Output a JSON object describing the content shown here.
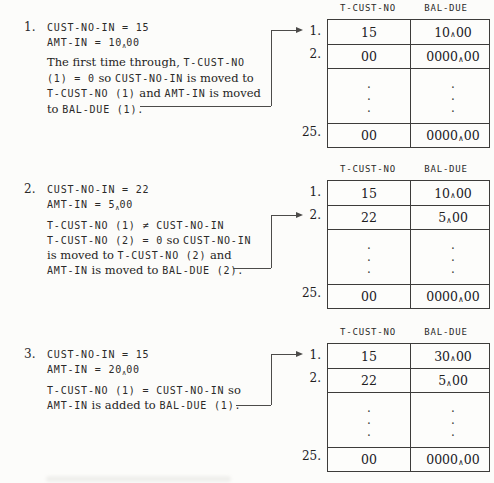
{
  "glyphs": {
    "dot": ".",
    "caret": "∧"
  },
  "sections": [
    {
      "number": "1.",
      "code": [
        [
          {
            "k": "c",
            "t": "CUST-NO-IN = 15"
          }
        ],
        [
          {
            "k": "c",
            "t": "AMT-IN = 10"
          },
          {
            "k": "x",
            "t": "∧"
          },
          {
            "k": "c",
            "t": "00"
          }
        ]
      ],
      "para": [
        [
          {
            "k": "p",
            "t": "The first time through, "
          },
          {
            "k": "c",
            "t": "T-CUST-NO"
          }
        ],
        [
          {
            "k": "c",
            "t": "(1) = 0"
          },
          {
            "k": "p",
            "t": " so "
          },
          {
            "k": "c",
            "t": "CUST-NO-IN"
          },
          {
            "k": "p",
            "t": " is moved to"
          }
        ],
        [
          {
            "k": "c",
            "t": "T-CUST-NO (1)"
          },
          {
            "k": "p",
            "t": " and "
          },
          {
            "k": "c",
            "t": "AMT-IN"
          },
          {
            "k": "p",
            "t": " is moved"
          }
        ],
        [
          {
            "k": "p",
            "t": "to "
          },
          {
            "k": "c",
            "t": "BAL-DUE (1)."
          }
        ]
      ]
    },
    {
      "number": "2.",
      "code": [
        [
          {
            "k": "c",
            "t": "CUST-NO-IN = 22"
          }
        ],
        [
          {
            "k": "c",
            "t": "AMT-IN = 5"
          },
          {
            "k": "x",
            "t": "∧"
          },
          {
            "k": "c",
            "t": "00"
          }
        ]
      ],
      "para": [
        [
          {
            "k": "c",
            "t": "T-CUST-NO (1) ≠ CUST-NO-IN"
          }
        ],
        [
          {
            "k": "c",
            "t": "T-CUST-NO (2) = 0"
          },
          {
            "k": "p",
            "t": " so "
          },
          {
            "k": "c",
            "t": "CUST-NO-IN"
          }
        ],
        [
          {
            "k": "p",
            "t": "is moved to "
          },
          {
            "k": "c",
            "t": "T-CUST-NO (2)"
          },
          {
            "k": "p",
            "t": " and"
          }
        ],
        [
          {
            "k": "c",
            "t": "AMT-IN"
          },
          {
            "k": "p",
            "t": " is moved to "
          },
          {
            "k": "c",
            "t": "BAL-DUE (2)."
          }
        ]
      ]
    },
    {
      "number": "3.",
      "code": [
        [
          {
            "k": "c",
            "t": "CUST-NO-IN = 15"
          }
        ],
        [
          {
            "k": "c",
            "t": "AMT-IN = 20"
          },
          {
            "k": "x",
            "t": "∧"
          },
          {
            "k": "c",
            "t": "00"
          }
        ]
      ],
      "para": [
        [
          {
            "k": "c",
            "t": "T-CUST-NO (1) = CUST-NO-IN"
          },
          {
            "k": "p",
            "t": " so"
          }
        ],
        [
          {
            "k": "c",
            "t": "AMT-IN"
          },
          {
            "k": "p",
            "t": " is added to "
          },
          {
            "k": "c",
            "t": "BAL-DUE (1)."
          }
        ]
      ]
    }
  ],
  "tables": [
    {
      "headers": [
        "T-CUST-NO",
        "BAL-DUE"
      ],
      "arrow_points_to": "1.",
      "rows": [
        {
          "label": "1.",
          "cust": "15",
          "bal_i": "10",
          "bal_d": "00"
        },
        {
          "label": "2.",
          "cust": "00",
          "bal_i": "0000",
          "bal_d": "00"
        },
        {
          "label": "25.",
          "cust": "00",
          "bal_i": "0000",
          "bal_d": "00"
        }
      ]
    },
    {
      "headers": [
        "T-CUST-NO",
        "BAL-DUE"
      ],
      "arrow_points_to": "2.",
      "rows": [
        {
          "label": "1.",
          "cust": "15",
          "bal_i": "10",
          "bal_d": "00"
        },
        {
          "label": "2.",
          "cust": "22",
          "bal_i": "5",
          "bal_d": "00"
        },
        {
          "label": "25.",
          "cust": "00",
          "bal_i": "0000",
          "bal_d": "00"
        }
      ]
    },
    {
      "headers": [
        "T-CUST-NO",
        "BAL-DUE"
      ],
      "arrow_points_to": "1.",
      "rows": [
        {
          "label": "1.",
          "cust": "15",
          "bal_i": "30",
          "bal_d": "00"
        },
        {
          "label": "2.",
          "cust": "22",
          "bal_i": "5",
          "bal_d": "00"
        },
        {
          "label": "25.",
          "cust": "00",
          "bal_i": "0000",
          "bal_d": "00"
        }
      ]
    }
  ]
}
